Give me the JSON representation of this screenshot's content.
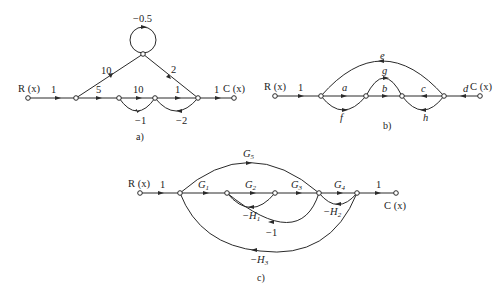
{
  "figures": [
    {
      "id": "a",
      "caption": "a)",
      "input_label": "R (x)",
      "output_label": "C (x)",
      "branch_gains": {
        "input": "1",
        "n1_to_n2": "5",
        "n2_to_n3": "10",
        "n3_to_n4": "1",
        "n4_to_output": "1",
        "n1_to_top": "10",
        "top_to_n4": "2",
        "self_loop": "−0.5",
        "n3_to_n2": "−1",
        "n4_to_n3": "−2"
      }
    },
    {
      "id": "b",
      "caption": "b)",
      "input_label": "R (x)",
      "output_label": "C (x)",
      "branch_gains": {
        "input": "1",
        "a": "a",
        "b": "b",
        "c": "c",
        "d": "d",
        "e": "e",
        "f": "f",
        "g": "g",
        "h": "h"
      }
    },
    {
      "id": "c",
      "caption": "c)",
      "input_label": "R (x)",
      "output_label": "C (x)",
      "branch_gains": {
        "input": "1",
        "G1": "G",
        "G1_sub": "1",
        "G2": "G",
        "G2_sub": "2",
        "G3": "G",
        "G3_sub": "3",
        "G4": "G",
        "G4_sub": "4",
        "G5": "G",
        "G5_sub": "5",
        "output": "1",
        "H1": "−H",
        "H1_sub": "1",
        "H2": "−H",
        "H2_sub": "2",
        "H3": "−H",
        "H3_sub": "3",
        "minus_one": "−1"
      }
    }
  ]
}
